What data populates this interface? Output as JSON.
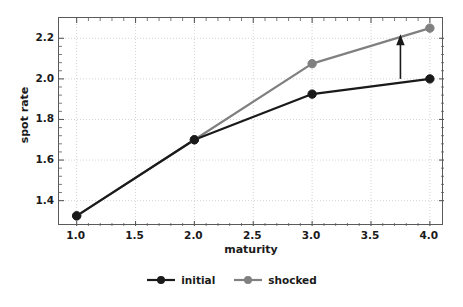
{
  "chart_data": {
    "type": "line",
    "title": "",
    "xlabel": "maturity",
    "ylabel": "spot rate",
    "x": [
      1.0,
      2.0,
      3.0,
      4.0
    ],
    "series": [
      {
        "name": "initial",
        "color": "#1a1a1a",
        "values": [
          1.325,
          1.7,
          1.925,
          2.0
        ]
      },
      {
        "name": "shocked",
        "color": "#808080",
        "values": [
          1.325,
          1.7,
          2.075,
          2.25
        ]
      }
    ],
    "xlim": [
      0.85,
      4.12
    ],
    "ylim": [
      1.275,
      2.3
    ],
    "xticks": [
      "1.0",
      "1.5",
      "2.0",
      "2.5",
      "3.0",
      "3.5",
      "4.0"
    ],
    "xtick_values": [
      1.0,
      1.5,
      2.0,
      2.5,
      3.0,
      3.5,
      4.0
    ],
    "yticks": [
      "1.4",
      "1.6",
      "1.8",
      "2.0",
      "2.2"
    ],
    "ytick_values": [
      1.4,
      1.6,
      1.8,
      2.0,
      2.2
    ],
    "grid": true,
    "legend_position": "bottom",
    "annotations": [
      {
        "name": "upward-shift-arrow",
        "type": "arrow",
        "x": 3.75,
        "y_start": 2.0,
        "y_end": 2.22,
        "direction": "up",
        "color": "#1a1a1a"
      }
    ]
  },
  "legend": {
    "items": [
      {
        "label": "initial",
        "color": "#1a1a1a"
      },
      {
        "label": "shocked",
        "color": "#808080"
      }
    ]
  },
  "colors": {
    "initial": "#1a1a1a",
    "shocked": "#808080",
    "grid": "#c8c8c8",
    "axis": "#5a5a5a",
    "background": "#ffffff"
  }
}
